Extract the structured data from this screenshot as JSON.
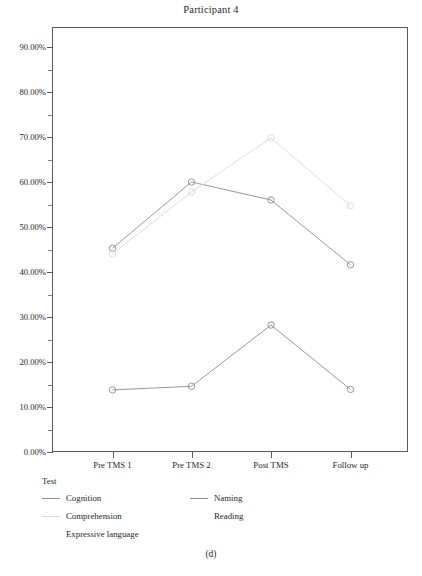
{
  "figure": {
    "title": "Participant 4",
    "sub_caption": "(d)"
  },
  "legend": {
    "title": "Test",
    "entries": [
      {
        "label": "Cognition",
        "color": "#8c8c8c",
        "show_swatch": true,
        "col": 0,
        "row": 0
      },
      {
        "label": "Comprehension",
        "color": "#d9d9d9",
        "show_swatch": true,
        "col": 0,
        "row": 1
      },
      {
        "label": "Expressive language",
        "color": "#f2f2f2",
        "show_swatch": false,
        "col": 0,
        "row": 2
      },
      {
        "label": "Naming",
        "color": "#8c8c8c",
        "show_swatch": true,
        "col": 1,
        "row": 0
      },
      {
        "label": "Reading",
        "color": "#fafafa",
        "show_swatch": false,
        "col": 1,
        "row": 1
      }
    ]
  },
  "axes": {
    "y_tick_labels": [
      "90.00%",
      "80.00%",
      "70.00%",
      "60.00%",
      "50.00%",
      "40.00%",
      "30.00%",
      "20.00%",
      "10.00%",
      "0.00%"
    ],
    "x_tick_labels": [
      "Pre TMS 1",
      "Pre TMS 2",
      "Post TMS",
      "Follow up"
    ]
  },
  "chart_data": {
    "type": "line",
    "title": "Participant 4",
    "xlabel": "",
    "ylabel": "",
    "categories": [
      "Pre TMS 1",
      "Pre TMS 2",
      "Post TMS",
      "Follow up"
    ],
    "ylim": [
      0,
      100
    ],
    "yticks": [
      0,
      10,
      20,
      30,
      40,
      50,
      60,
      70,
      80,
      90
    ],
    "ytick_format": "percent",
    "grid": false,
    "legend_title": "Test",
    "legend_position": "below",
    "markers": "open-circle",
    "series": [
      {
        "name": "Cognition",
        "color": "#8c8c8c",
        "values": [
          45.3,
          60.0,
          56.0,
          41.6
        ]
      },
      {
        "name": "Comprehension",
        "color": "#d9d9d9",
        "values": [
          44.0,
          57.8,
          69.8,
          54.7
        ]
      },
      {
        "name": "Expressive language",
        "color": "#f2f2f2",
        "values": [
          null,
          null,
          null,
          null
        ]
      },
      {
        "name": "Naming",
        "color": "#8c8c8c",
        "values": [
          13.8,
          14.6,
          28.2,
          13.9
        ]
      },
      {
        "name": "Reading",
        "color": "#fafafa",
        "values": [
          null,
          null,
          null,
          null
        ]
      }
    ]
  }
}
